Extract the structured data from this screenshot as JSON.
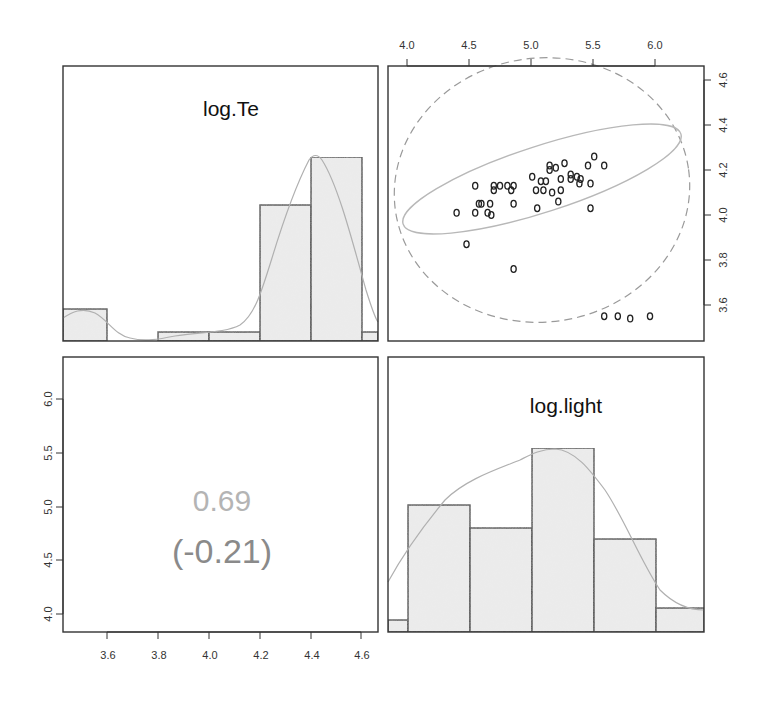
{
  "chart_data": {
    "type": "pairs-panel",
    "variables": [
      "log.Te",
      "log.light"
    ],
    "panels": [
      {
        "position": "top-left",
        "type": "histogram",
        "title": "log.Te",
        "bins": [
          3.4,
          3.6,
          3.8,
          4.0,
          4.2,
          4.4,
          4.6,
          4.8
        ],
        "counts": [
          4,
          0,
          1,
          1,
          15,
          20,
          1
        ],
        "density_curve": true,
        "xlim": [
          3.43,
          4.66
        ]
      },
      {
        "position": "top-right",
        "type": "scatter",
        "xlabel": "log.light",
        "ylabel": "log.Te",
        "x_ticks": [
          "4.0",
          "4.5",
          "5.0",
          "5.5",
          "6.0"
        ],
        "y_ticks": [
          "3.6",
          "3.8",
          "4.0",
          "4.2",
          "4.4",
          "4.6"
        ],
        "xlim": [
          3.85,
          6.38
        ],
        "ylim": [
          3.46,
          4.66
        ],
        "points": [
          [
            4.4,
            4.01
          ],
          [
            4.48,
            3.87
          ],
          [
            4.55,
            4.13
          ],
          [
            4.55,
            4.01
          ],
          [
            4.58,
            4.05
          ],
          [
            4.6,
            4.05
          ],
          [
            4.65,
            4.01
          ],
          [
            4.67,
            4.05
          ],
          [
            4.68,
            4.0
          ],
          [
            4.7,
            4.13
          ],
          [
            4.7,
            4.11
          ],
          [
            4.75,
            4.13
          ],
          [
            4.81,
            4.13
          ],
          [
            4.84,
            4.11
          ],
          [
            4.86,
            4.13
          ],
          [
            4.86,
            4.05
          ],
          [
            4.86,
            3.76
          ],
          [
            5.01,
            4.17
          ],
          [
            5.04,
            4.11
          ],
          [
            5.05,
            4.03
          ],
          [
            5.08,
            4.15
          ],
          [
            5.1,
            4.11
          ],
          [
            5.12,
            4.15
          ],
          [
            5.15,
            4.22
          ],
          [
            5.15,
            4.2
          ],
          [
            5.17,
            4.1
          ],
          [
            5.2,
            4.21
          ],
          [
            5.22,
            4.06
          ],
          [
            5.24,
            4.16
          ],
          [
            5.24,
            4.11
          ],
          [
            5.27,
            4.23
          ],
          [
            5.32,
            4.18
          ],
          [
            5.32,
            4.16
          ],
          [
            5.37,
            4.17
          ],
          [
            5.39,
            4.14
          ],
          [
            5.4,
            4.16
          ],
          [
            5.46,
            4.22
          ],
          [
            5.48,
            4.14
          ],
          [
            5.48,
            4.03
          ],
          [
            5.51,
            4.26
          ],
          [
            5.59,
            4.22
          ],
          [
            5.59,
            3.55
          ],
          [
            5.7,
            3.55
          ],
          [
            5.8,
            3.54
          ],
          [
            5.96,
            3.55
          ]
        ],
        "ellipses": [
          {
            "style": "solid",
            "color": "#b8b8b8",
            "label": "robust"
          },
          {
            "style": "dashed",
            "color": "#9a9a9a",
            "label": "classical"
          }
        ]
      },
      {
        "position": "bottom-left",
        "type": "correlation",
        "robust_correlation": "0.69",
        "classical_correlation": "(-0.21)",
        "x_ticks": [
          "3.6",
          "3.8",
          "4.0",
          "4.2",
          "4.4",
          "4.6"
        ],
        "y_ticks": [
          "4.0",
          "4.5",
          "5.0",
          "5.5",
          "6.0"
        ]
      },
      {
        "position": "bottom-right",
        "type": "histogram",
        "title": "log.light",
        "bins": [
          3.5,
          4.0,
          4.5,
          5.0,
          5.5,
          6.0,
          6.5
        ],
        "counts": [
          1,
          10,
          8,
          12,
          7,
          2
        ],
        "density_curve": true,
        "xlim": [
          3.85,
          6.38
        ]
      }
    ],
    "colors": {
      "bar_fill": "#ebebeb",
      "bar_stroke": "#333333",
      "density_line": "#b0b0b0",
      "corr_main": "#b4b4b4",
      "corr_sub": "#8a8a8a",
      "point": "#222222",
      "frame": "#333333"
    }
  },
  "labels": {
    "te_title": "log.Te",
    "light_title": "log.light",
    "corr_value": "0.69",
    "corr_classical": "(-0.21)",
    "top_axis": [
      "4.0",
      "4.5",
      "5.0",
      "5.5",
      "6.0"
    ],
    "right_axis": [
      "3.6",
      "3.8",
      "4.0",
      "4.2",
      "4.4",
      "4.6"
    ],
    "left_axis": [
      "4.0",
      "4.5",
      "5.0",
      "5.5",
      "6.0"
    ],
    "bottom_axis": [
      "3.6",
      "3.8",
      "4.0",
      "4.2",
      "4.4",
      "4.6"
    ]
  }
}
